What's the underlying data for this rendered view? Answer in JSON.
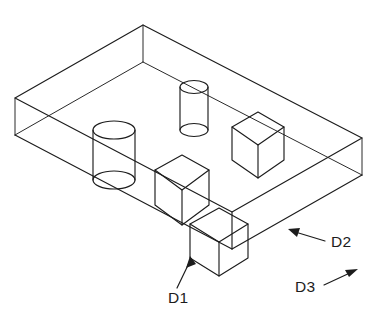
{
  "figure": {
    "background_color": "#ffffff",
    "line_color": "#1c1c1c",
    "labels": [
      {
        "id": "D1",
        "text": "D1",
        "x": 168,
        "y": 300,
        "points_to": "front-protruding-cube-bottom-vertex"
      },
      {
        "id": "D2",
        "text": "D2",
        "x": 331,
        "y": 245,
        "points_to": "slab-front-right-edge"
      },
      {
        "id": "D3",
        "text": "D3",
        "x": 295,
        "y": 290,
        "points_to": "direction-arrow-up-right"
      }
    ],
    "features": [
      {
        "name": "large-cylinder",
        "type": "cylinder",
        "center_x": 114,
        "top_y": 130,
        "bottom_y": 180,
        "radius_x": 21,
        "radius_y": 9
      },
      {
        "name": "small-cylinder",
        "type": "cylinder",
        "center_x": 194,
        "top_y": 87,
        "bottom_y": 130,
        "radius_x": 14,
        "radius_y": 6
      },
      {
        "name": "right-cube",
        "type": "cube",
        "center_x": 258,
        "center_y": 145,
        "half_width": 26,
        "half_height": 33
      },
      {
        "name": "middle-cube",
        "type": "cube",
        "center_x": 182,
        "center_y": 190,
        "half_width": 27,
        "half_height": 35
      },
      {
        "name": "front-cube",
        "type": "cube",
        "center_x": 219,
        "center_y": 242,
        "half_width": 29,
        "half_height": 34
      }
    ],
    "slab": {
      "name": "rectangular-slab",
      "top_back_vertex": [
        143,
        25
      ],
      "left_vertex": [
        15,
        98
      ],
      "right_vertex": [
        362,
        138
      ],
      "front_vertex": [
        232,
        212
      ],
      "thickness": 37
    }
  }
}
